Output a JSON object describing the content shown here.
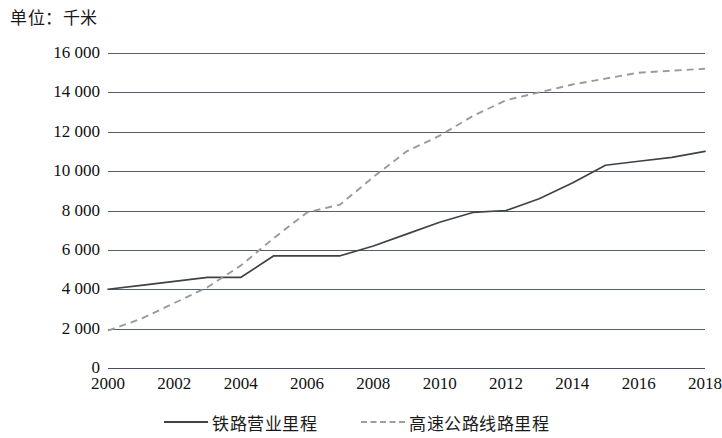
{
  "unit_caption": "单位：千米",
  "legend": {
    "position": "bottom-center",
    "entries": [
      {
        "label": "铁路营业里程",
        "style": "solid",
        "color": "#3e4348"
      },
      {
        "label": "高速公路线路里程",
        "style": "dashed",
        "color": "#9e9e9e"
      }
    ]
  },
  "axes": {
    "y_ticks": [
      "0",
      "2 000",
      "4 000",
      "6 000",
      "8 000",
      "10 000",
      "12 000",
      "14 000",
      "16 000"
    ],
    "x_ticks": [
      "2000",
      "2002",
      "2004",
      "2006",
      "2008",
      "2010",
      "2012",
      "2014",
      "2016",
      "2018"
    ]
  },
  "chart_data": {
    "type": "line",
    "title": "",
    "subtitle": "",
    "xlabel": "",
    "ylabel": "单位：千米",
    "xlim": [
      2000,
      2018
    ],
    "ylim": [
      0,
      16000
    ],
    "y_tick_step": 2000,
    "x_tick_step": 2,
    "grid": true,
    "grid_axis": "y",
    "legend_position": "bottom-center",
    "x": [
      2000,
      2001,
      2002,
      2003,
      2004,
      2005,
      2006,
      2007,
      2008,
      2009,
      2010,
      2011,
      2012,
      2013,
      2014,
      2015,
      2016,
      2017,
      2018
    ],
    "series": [
      {
        "name": "铁路营业里程",
        "style": "solid",
        "color": "#3e4348",
        "values": [
          4000,
          4200,
          4400,
          4600,
          4600,
          5700,
          5700,
          5700,
          6200,
          6800,
          7400,
          7900,
          8000,
          8600,
          9400,
          10300,
          10500,
          10700,
          11000
        ]
      },
      {
        "name": "高速公路线路里程",
        "style": "dashed",
        "color": "#9e9e9e",
        "values": [
          1900,
          2500,
          3300,
          4100,
          5200,
          6600,
          7900,
          8300,
          9700,
          11000,
          11800,
          12800,
          13600,
          14000,
          14400,
          14700,
          15000,
          15100,
          15200
        ]
      }
    ]
  }
}
